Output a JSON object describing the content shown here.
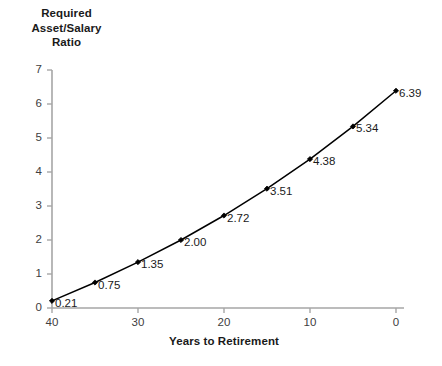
{
  "chart_data": {
    "type": "line",
    "title": "",
    "ylabel": "Required\nAsset/Salary\nRatio",
    "ylabel_lines": [
      "Required",
      "Asset/Salary",
      "Ratio"
    ],
    "xlabel": "Years to Retirement",
    "x": [
      40,
      35,
      30,
      25,
      20,
      15,
      10,
      5,
      0
    ],
    "values": [
      0.21,
      0.75,
      1.35,
      2.0,
      2.72,
      3.51,
      4.38,
      5.34,
      6.39
    ],
    "point_labels": [
      "0.21",
      "0.75",
      "1.35",
      "2.00",
      "2.72",
      "3.51",
      "4.38",
      "5.34",
      "6.39"
    ],
    "xlim": [
      40,
      0
    ],
    "ylim": [
      0,
      7
    ],
    "x_reversed": true,
    "xticks": [
      40,
      30,
      20,
      10,
      0
    ],
    "xtick_labels": [
      "40",
      "30",
      "20",
      "10",
      "0"
    ],
    "yticks": [
      0,
      1,
      2,
      3,
      4,
      5,
      6,
      7
    ],
    "ytick_labels": [
      "0",
      "1",
      "2",
      "3",
      "4",
      "5",
      "6",
      "7"
    ],
    "grid": false,
    "legend": false,
    "series_color": "#000000",
    "axis_color": "#a6a6a6",
    "marker": "diamond"
  }
}
